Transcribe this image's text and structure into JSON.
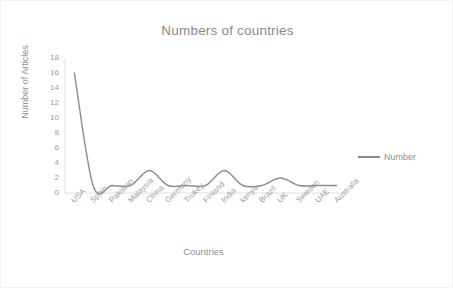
{
  "chart_data": {
    "type": "line",
    "title": "Numbers of countries",
    "xlabel": "Countries",
    "ylabel": "Number of Articles",
    "categories": [
      "USA",
      "Spain",
      "Pakistan",
      "Malaysia",
      "China",
      "Germany",
      "Trukey",
      "Finland",
      "India",
      "kenya",
      "Brazil",
      "UK",
      "Sweden",
      "UAE",
      "Australia"
    ],
    "values": [
      16,
      1,
      1,
      1,
      3,
      1,
      1,
      1,
      3,
      1,
      1,
      2,
      1,
      1,
      1
    ],
    "series": [
      {
        "name": "Number",
        "values": [
          16,
          1,
          1,
          1,
          3,
          1,
          1,
          1,
          3,
          1,
          1,
          2,
          1,
          1,
          1
        ],
        "color": "#8c8c8c",
        "smooth": true
      }
    ],
    "ylim": [
      0,
      18
    ],
    "yticks": [
      0,
      2,
      4,
      6,
      8,
      10,
      12,
      14,
      16,
      18
    ],
    "ytick_labels": [
      "0",
      "2",
      "4",
      "6",
      "8",
      "10",
      "12",
      "14",
      "16",
      "18"
    ],
    "grid": false,
    "legend": {
      "position": "right",
      "entries": [
        "Number"
      ]
    },
    "line_color": "#8c8c8c",
    "text_color": "#8f8f8f",
    "axis_color": "#e2e2e2",
    "background": "#ffffff"
  }
}
